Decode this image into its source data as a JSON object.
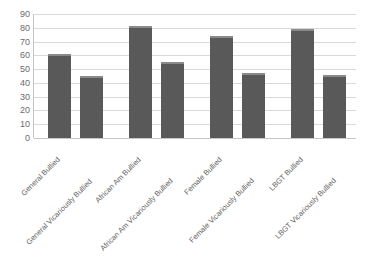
{
  "chart_data": {
    "type": "bar",
    "title": "",
    "subtitle": "",
    "xlabel": "",
    "ylabel": "",
    "ylim": [
      0,
      90
    ],
    "ytick_step": 10,
    "yticks": [
      90,
      80,
      70,
      60,
      50,
      40,
      30,
      20,
      10,
      0
    ],
    "grid": true,
    "legend": false,
    "legend_position": "none",
    "bar_color": "#595959",
    "bar_top_highlight_color": "#8a8a8a",
    "gridline_color": "#d9d9d9",
    "background_color": "#ffffff",
    "label_rotation_degrees": -45,
    "categories": [
      "General Bullied",
      "General Vicariously Bullied",
      "African Am Bullied",
      "African Am Vicariously Bullied",
      "Female Bullied",
      "Female Vicariously Bullied",
      "LBGT Bullied",
      "LBGT Vicariously Bullied"
    ],
    "values": [
      61,
      45,
      81,
      55,
      74,
      47,
      79,
      46
    ]
  }
}
